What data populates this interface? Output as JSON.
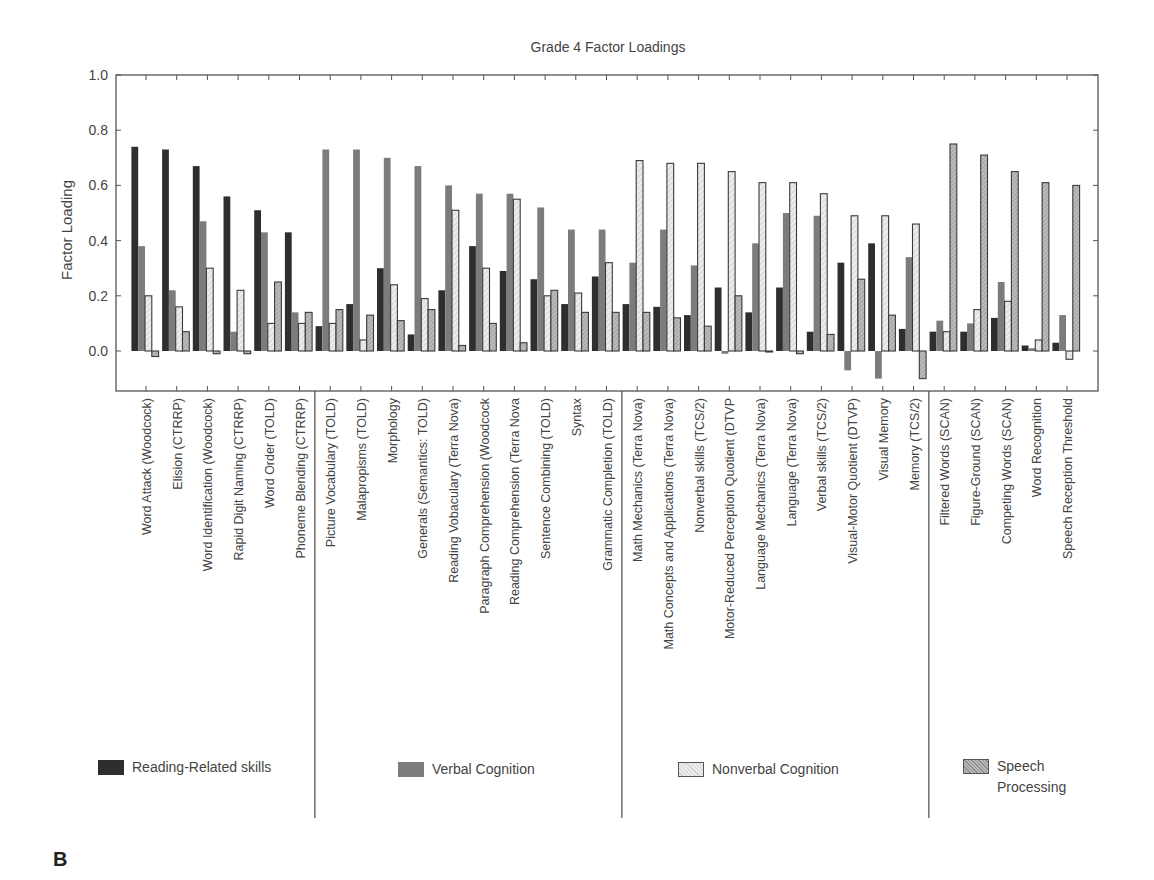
{
  "chart_data": {
    "type": "bar",
    "title": "Grade 4 Factor Loadings",
    "xlabel": "",
    "ylabel": "Factor Loading",
    "ylim": [
      -0.15,
      1.0
    ],
    "yticks": [
      0.0,
      0.2,
      0.4,
      0.6,
      0.8,
      1.0
    ],
    "ytick_labels": [
      "0.0",
      "0.2",
      "0.4",
      "0.6",
      "0.8",
      "1.0"
    ],
    "grid": false,
    "legend_position": "bottom",
    "categories": [
      "Word Attack (Woodcock)",
      "Elision (CTRRP)",
      "Word Identification (Woodcock)",
      "Rapid Digit Naming (CTRRP)",
      "Word Order (TOLD)",
      "Phoneme Blending (CTRRP)",
      "Picture Vocabulary (TOLD)",
      "Malapropisms (TOLD)",
      "Morphology",
      "Generals (Semantics: TOLD)",
      "Reading Vobaculary (Terra Nova)",
      "Paragraph Comprehension (Woodcock",
      "Reading Comprehension (Terra Nova",
      "Sentence Combining (TOLD)",
      "Syntax",
      "Grammatic Completion (TOLD)",
      "Math Mechanics (Terra Nova)",
      "Math Concepts and Applications (Terra Nova)",
      "Nonverbal skills (TCS/2)",
      "Motor-Reduced Perception Quotient (DTVP",
      "Language Mechanics (Terra Nova)",
      "Language (Terra Nova)",
      "Verbal skills (TCS/2)",
      "Visual-Motor Quotient (DTVP)",
      "Visual Memory",
      "Memory (TCS/2)",
      "Filtered Words (SCAN)",
      "Figure-Ground (SCAN)",
      "Competing Words (SCAN)",
      "Word Recognition",
      "Speech Reception Threshold"
    ],
    "groups": [
      {
        "name": "Reading-Related skills",
        "start": 0,
        "end": 5
      },
      {
        "name": "Verbal Cognition",
        "start": 6,
        "end": 15
      },
      {
        "name": "Nonverbal Cognition",
        "start": 16,
        "end": 25
      },
      {
        "name": "Speech Processing",
        "start": 26,
        "end": 30
      }
    ],
    "series": [
      {
        "name": "Reading-Related skills",
        "color": "#2b2b2b",
        "values": [
          0.74,
          0.73,
          0.67,
          0.56,
          0.51,
          0.43,
          0.09,
          0.17,
          0.3,
          0.06,
          0.22,
          0.38,
          0.29,
          0.26,
          0.17,
          0.27,
          0.17,
          0.16,
          0.13,
          0.23,
          0.14,
          0.23,
          0.07,
          0.32,
          0.39,
          0.08,
          0.07,
          0.07,
          0.12,
          0.02,
          0.03
        ]
      },
      {
        "name": "Verbal Cognition",
        "color": "#7a7a7a",
        "values": [
          0.38,
          0.22,
          0.47,
          0.07,
          0.43,
          0.14,
          0.73,
          0.73,
          0.7,
          0.67,
          0.6,
          0.57,
          0.57,
          0.52,
          0.44,
          0.44,
          0.32,
          0.44,
          0.31,
          -0.01,
          0.39,
          0.5,
          0.49,
          -0.07,
          -0.1,
          0.34,
          0.11,
          0.1,
          0.25,
          0.01,
          0.13
        ]
      },
      {
        "name": "Nonverbal Cognition",
        "color": "#e4e4e4",
        "values": [
          0.2,
          0.16,
          0.3,
          0.22,
          0.1,
          0.1,
          0.1,
          0.04,
          0.24,
          0.19,
          0.51,
          0.3,
          0.55,
          0.2,
          0.21,
          0.32,
          0.69,
          0.68,
          0.68,
          0.65,
          0.61,
          0.61,
          0.57,
          0.49,
          0.49,
          0.46,
          0.07,
          0.15,
          0.18,
          0.04,
          -0.03
        ]
      },
      {
        "name": "Speech Processing",
        "color": "#b5b5b5",
        "values": [
          -0.02,
          0.07,
          -0.01,
          -0.01,
          0.25,
          0.14,
          0.15,
          0.13,
          0.11,
          0.15,
          0.02,
          0.1,
          0.03,
          0.22,
          0.14,
          0.14,
          0.14,
          0.12,
          0.09,
          0.2,
          0.0,
          -0.01,
          0.06,
          0.26,
          0.13,
          -0.1,
          0.75,
          0.71,
          0.65,
          0.61,
          0.6
        ]
      }
    ]
  },
  "page": {
    "panel_letter": "B"
  }
}
